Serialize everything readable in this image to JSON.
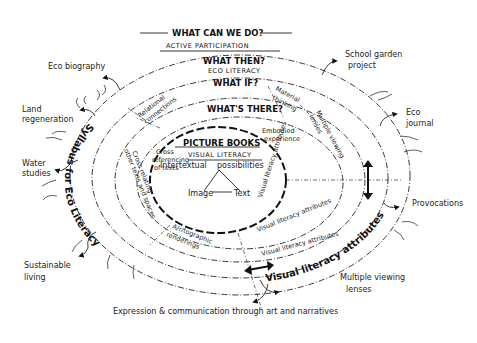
{
  "header": {
    "question": "WHAT CAN WE DO?",
    "subtitle": "ACTIVE PARTICIPATION"
  },
  "rings": [
    {
      "id": "ring-what-then",
      "question": "WHAT THEN?",
      "subtitle": "ECO LITERACY"
    },
    {
      "id": "ring-what-if",
      "question": "WHAT IF?"
    },
    {
      "id": "ring-whats-there",
      "question": "WHAT'S THERE?"
    }
  ],
  "core": {
    "title": "PICTURE BOOKS",
    "subtitle": "VISUAL LITERACY",
    "left_label": "Intertextual",
    "right_label": "possibilities",
    "triangle": {
      "image": "Image",
      "text": "Text"
    }
  },
  "inner_segments": {
    "relational_connections": [
      "Relational",
      "connections"
    ],
    "material_thinking": [
      "Material",
      "thinking"
    ],
    "multiple_viewing_lenses_inner": [
      "Multiple viewing",
      "lenses"
    ],
    "embodied_experience": [
      "Embodied",
      "experience"
    ],
    "cross_referencing": [
      "Cross",
      "referencing",
      "of texts"
    ],
    "cross_relating": [
      "Cross relating",
      "other texts and spaces"
    ],
    "artographic": [
      "A/r/tographic",
      "renderings"
    ],
    "vl_attributes_1": "Visual literacy attributes",
    "vl_attributes_2": "Visual literacy attributes",
    "vl_attributes_3": "Visual literacy attributes"
  },
  "outer_band": {
    "left": "Syllabus for Eco Literacy",
    "right": "Visual literacy attributes"
  },
  "outer_labels": [
    {
      "id": "eco-biography",
      "lines": [
        "Eco biography"
      ]
    },
    {
      "id": "land-regeneration",
      "lines": [
        "Land",
        "regeneration"
      ]
    },
    {
      "id": "water-studies",
      "lines": [
        "Water",
        "studies"
      ]
    },
    {
      "id": "sustainable-living",
      "lines": [
        "Sustainable",
        "living"
      ]
    },
    {
      "id": "school-garden-project",
      "lines": [
        "School garden",
        "project"
      ]
    },
    {
      "id": "eco-journal",
      "lines": [
        "Eco",
        "journal"
      ]
    },
    {
      "id": "provocations",
      "lines": [
        "Provocations"
      ]
    },
    {
      "id": "multiple-viewing-lenses",
      "lines": [
        "Multiple viewing",
        "lenses"
      ]
    }
  ],
  "footer": {
    "caption": "Expression & communication through art and narratives"
  },
  "icons": {
    "double_arrow_vertical": "double-arrow-vertical",
    "double_arrow_horizontal": "double-arrow-horizontal"
  }
}
